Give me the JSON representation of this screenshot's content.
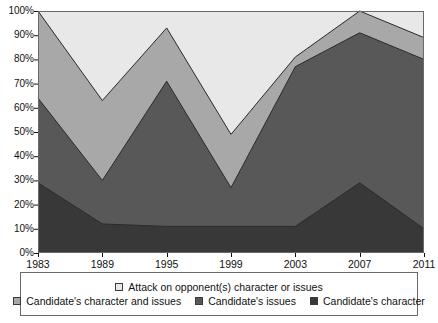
{
  "chart_data": {
    "type": "area",
    "stacked": "100%",
    "title": "",
    "subtitle": "",
    "xlabel": "",
    "ylabel": "",
    "categories": [
      "1983",
      "1989",
      "1995",
      "1999",
      "2003",
      "2007",
      "2011"
    ],
    "x": [
      1983,
      1989,
      1995,
      1999,
      2003,
      2007,
      2011
    ],
    "ylim": [
      0,
      100
    ],
    "ytick_labels": [
      "0%",
      "10%",
      "20%",
      "30%",
      "40%",
      "50%",
      "60%",
      "70%",
      "80%",
      "90%",
      "100%"
    ],
    "ytick_values": [
      0,
      10,
      20,
      30,
      40,
      50,
      60,
      70,
      80,
      90,
      100
    ],
    "grid": false,
    "legend_position": "bottom",
    "series": [
      {
        "name": "Candidate's character",
        "color": "#383838",
        "values": [
          29,
          12,
          11,
          11,
          11,
          29,
          10
        ],
        "cumulative": [
          29,
          12,
          11,
          11,
          11,
          29,
          10
        ]
      },
      {
        "name": "Candidate's issues",
        "color": "#585858",
        "values": [
          35,
          18,
          60,
          16,
          66,
          62,
          70
        ],
        "cumulative": [
          64,
          30,
          71,
          27,
          77,
          91,
          80
        ]
      },
      {
        "name": "Candidate's character and issues",
        "color": "#a8a8a8",
        "values": [
          36,
          33,
          22,
          22,
          4,
          9,
          9
        ],
        "cumulative": [
          100,
          63,
          93,
          49,
          81,
          100,
          89
        ]
      },
      {
        "name": "Attack on opponent(s) character or issues",
        "color": "#e8e8e8",
        "values": [
          0,
          37,
          7,
          51,
          19,
          0,
          11
        ],
        "cumulative": [
          100,
          100,
          100,
          100,
          100,
          100,
          100
        ]
      }
    ]
  },
  "legend": {
    "row1": [
      {
        "label": "Attack on opponent(s) character or issues",
        "color": "#e8e8e8",
        "swatch_name": "legend-swatch-attack-on-opponent"
      }
    ],
    "row2": [
      {
        "label": "Candidate's character and issues",
        "color": "#a8a8a8",
        "swatch_name": "legend-swatch-candidates-character-and-issues"
      },
      {
        "label": "Candidate's issues",
        "color": "#585858",
        "swatch_name": "legend-swatch-candidates-issues"
      },
      {
        "label": "Candidate's character",
        "color": "#383838",
        "swatch_name": "legend-swatch-candidates-character"
      }
    ]
  },
  "axes": {
    "y_labels": [
      "100%",
      "90%",
      "80%",
      "70%",
      "60%",
      "50%",
      "40%",
      "30%",
      "20%",
      "10%",
      "0%"
    ],
    "x_labels": [
      "1983",
      "1989",
      "1995",
      "1999",
      "2003",
      "2007",
      "2011"
    ]
  },
  "colors": {
    "plot_border": "#6a6a6a",
    "series_line": "#2a2a2a",
    "background": "#ffffff",
    "text": "#111111"
  }
}
